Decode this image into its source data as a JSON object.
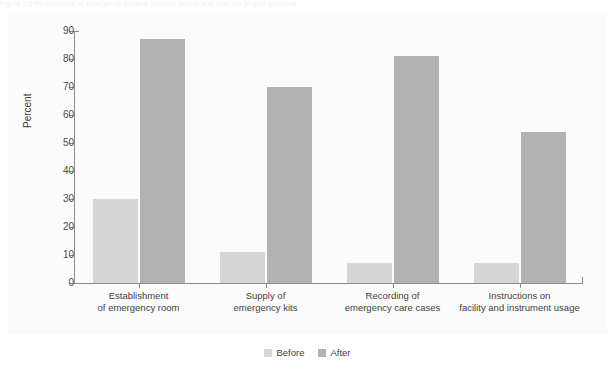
{
  "figure": {
    "caption_cutoff": "Figure 2.6  Performance of emergency medical services before and after the project (percent)"
  },
  "chart_data": {
    "type": "bar",
    "title": "",
    "xlabel": "",
    "ylabel": "Percent",
    "ylim": [
      0,
      90
    ],
    "ytick_step": 10,
    "grid": false,
    "legend_position": "bottom-center",
    "categories": [
      "Establishment\nof emergency room",
      "Supply of\nemergency kits",
      "Recording of\nemergency care cases",
      "Instructions on\nfacility and instrument usage"
    ],
    "ytick_labels": [
      "0",
      "10",
      "20",
      "30",
      "40",
      "50",
      "60",
      "70",
      "80",
      "90"
    ],
    "ytick_values": [
      0,
      10,
      20,
      30,
      40,
      50,
      60,
      70,
      80,
      90
    ],
    "series": [
      {
        "name": "Before",
        "color": "#d6d6d6",
        "values": [
          30,
          11,
          7,
          7
        ]
      },
      {
        "name": "After",
        "color": "#b2b2b2",
        "values": [
          87,
          70,
          81,
          54
        ]
      }
    ]
  },
  "colors": {
    "before": "#d6d6d6",
    "after": "#b2b2b2",
    "axis": "#8a8a8a",
    "text": "#3f3f3f",
    "panel": "#fbfbfb"
  }
}
